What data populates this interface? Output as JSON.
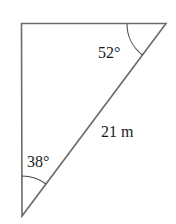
{
  "diagram": {
    "type": "right-triangle",
    "vertices": {
      "top_left": [
        21,
        23
      ],
      "top_right": [
        166,
        23
      ],
      "bottom": [
        22,
        216
      ]
    },
    "stroke_color": "#6b6b6b",
    "labels": {
      "angle_top_right": "52°",
      "angle_bottom": "38°",
      "hypotenuse": "21 m"
    }
  }
}
